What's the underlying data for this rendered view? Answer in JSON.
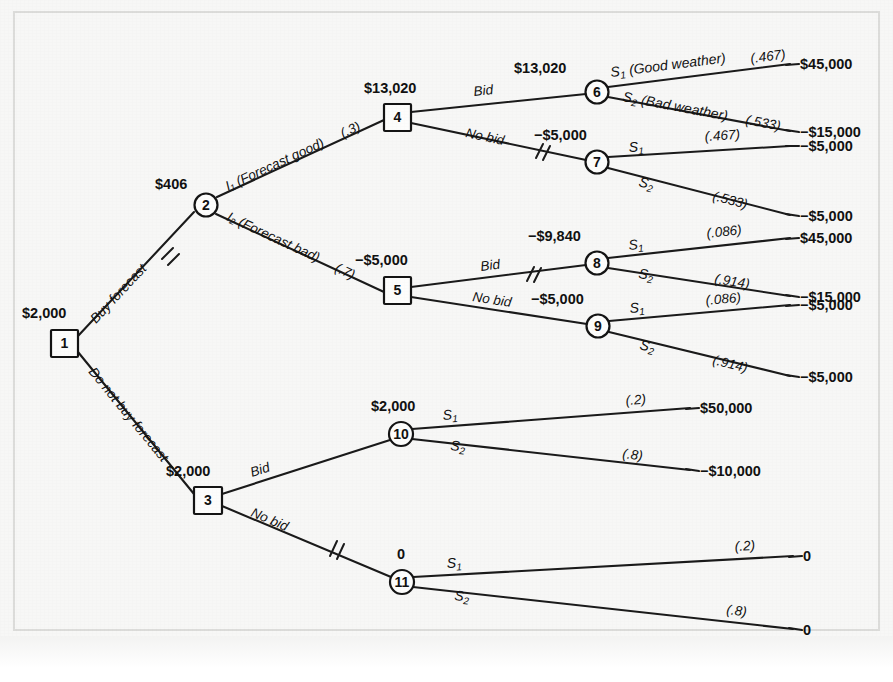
{
  "diagram": {
    "type": "decision-tree",
    "ink_color": "#141414",
    "paper_color": "#f7f7f6"
  },
  "nodes": [
    {
      "id": "1",
      "shape": "square",
      "label": "1",
      "ev": "$2,000",
      "x": 64,
      "y": 343
    },
    {
      "id": "2",
      "shape": "circle",
      "label": "2",
      "ev": "$406",
      "x": 206,
      "y": 205
    },
    {
      "id": "3",
      "shape": "square",
      "label": "3",
      "ev": "$2,000",
      "x": 208,
      "y": 500
    },
    {
      "id": "4",
      "shape": "square",
      "label": "4",
      "ev": "$13,020",
      "x": 397,
      "y": 117
    },
    {
      "id": "5",
      "shape": "square",
      "label": "5",
      "ev": "−$5,000",
      "x": 397,
      "y": 290
    },
    {
      "id": "6",
      "shape": "circle",
      "label": "6",
      "ev": "$13,020",
      "x": 597,
      "y": 92
    },
    {
      "id": "7",
      "shape": "circle",
      "label": "7",
      "ev": "−$5,000",
      "x": 597,
      "y": 162
    },
    {
      "id": "8",
      "shape": "circle",
      "label": "8",
      "ev": "−$9,840",
      "x": 597,
      "y": 263
    },
    {
      "id": "9",
      "shape": "circle",
      "label": "9",
      "ev": "−$5,000",
      "x": 598,
      "y": 326
    },
    {
      "id": "10",
      "shape": "circle",
      "label": "10",
      "ev": "$2,000",
      "x": 401,
      "y": 434
    },
    {
      "id": "11",
      "shape": "circle",
      "label": "11",
      "ev": "0",
      "x": 402,
      "y": 582
    }
  ],
  "branches": [
    {
      "from": "1",
      "to": "2",
      "label": "Buy forecast",
      "probability": "",
      "pruned": true
    },
    {
      "from": "1",
      "to": "3",
      "label": "Do not buy forecast",
      "probability": "",
      "pruned": false
    },
    {
      "from": "2",
      "to": "4",
      "label": "I₁ (Forecast good)",
      "probability": "(.3)",
      "pruned": false
    },
    {
      "from": "2",
      "to": "5",
      "label": "I₂ (Forecast bad)",
      "probability": "(.7)",
      "pruned": false
    },
    {
      "from": "4",
      "to": "6",
      "label": "Bid",
      "probability": "",
      "pruned": false
    },
    {
      "from": "4",
      "to": "7",
      "label": "No bid",
      "probability": "",
      "pruned": true
    },
    {
      "from": "5",
      "to": "8",
      "label": "Bid",
      "probability": "",
      "pruned": true
    },
    {
      "from": "5",
      "to": "9",
      "label": "No bid",
      "probability": "",
      "pruned": false
    },
    {
      "from": "3",
      "to": "10",
      "label": "Bid",
      "probability": "",
      "pruned": false
    },
    {
      "from": "3",
      "to": "11",
      "label": "No bid",
      "probability": "",
      "pruned": true
    }
  ],
  "outcome_branches": [
    {
      "from": "6",
      "state": "S₁ (Good weather)",
      "probability": "(.467)",
      "payoff": "$45,000"
    },
    {
      "from": "6",
      "state": "S₂ (Bad weather)",
      "probability": "(.533)",
      "payoff": "−$15,000"
    },
    {
      "from": "7",
      "state": "S₁",
      "probability": "(.467)",
      "payoff": "−$5,000"
    },
    {
      "from": "7",
      "state": "S₂",
      "probability": "(.533)",
      "payoff": "−$5,000"
    },
    {
      "from": "8",
      "state": "S₁",
      "probability": "(.086)",
      "payoff": "$45,000"
    },
    {
      "from": "8",
      "state": "S₂",
      "probability": "(.914)",
      "payoff": "−$15,000"
    },
    {
      "from": "9",
      "state": "S₁",
      "probability": "(.086)",
      "payoff": "−$5,000"
    },
    {
      "from": "9",
      "state": "S₂",
      "probability": "(.914)",
      "payoff": "−$5,000"
    },
    {
      "from": "10",
      "state": "S₁",
      "probability": "(.2)",
      "payoff": "$50,000"
    },
    {
      "from": "10",
      "state": "S₂",
      "probability": "(.8)",
      "payoff": "−$10,000"
    },
    {
      "from": "11",
      "state": "S₁",
      "probability": "(.2)",
      "payoff": "0"
    },
    {
      "from": "11",
      "state": "S₂",
      "probability": "(.8)",
      "payoff": "0"
    }
  ],
  "labels": {
    "node1_ev": "$2,000",
    "node2_ev": "$406",
    "node3_ev": "$2,000",
    "node4_ev": "$13,020",
    "node5_ev": "−$5,000",
    "node6_ev": "$13,020",
    "node7_ev": "−$5,000",
    "node8_ev": "−$9,840",
    "node9_ev": "−$5,000",
    "node10_ev": "$2,000",
    "node11_ev": "0",
    "n1": "1",
    "n2": "2",
    "n3": "3",
    "n4": "4",
    "n5": "5",
    "n6": "6",
    "n7": "7",
    "n8": "8",
    "n9": "9",
    "n10": "10",
    "n11": "11",
    "buy_forecast": "Buy forecast",
    "do_not_buy_forecast": "Do not buy forecast",
    "forecast_good": "I₁ (Forecast good)",
    "forecast_good_p": "(.3)",
    "forecast_bad": "I₂ (Forecast bad)",
    "forecast_bad_p": "(.7)",
    "bid_4": "Bid",
    "nobid_4": "No bid",
    "bid_5": "Bid",
    "nobid_5": "No bid",
    "bid_3": "Bid",
    "nobid_3": "No bid",
    "s1_good_weather": "S₁ (Good weather)",
    "s2_bad_weather": "S₂ (Bad weather)",
    "s1": "S₁",
    "s2": "S₂",
    "p_467a": "(.467)",
    "p_533a": "(.533)",
    "p_467b": "(.467)",
    "p_533b": "(.533)",
    "p_086a": "(.086)",
    "p_914a": "(.914)",
    "p_086b": "(.086)",
    "p_914b": "(.914)",
    "p_2a": "(.2)",
    "p_8a": "(.8)",
    "p_2b": "(.2)",
    "p_8b": "(.8)",
    "pay_45000a": "$45,000",
    "pay_15000a": "−$15,000",
    "pay_5000a": "−$5,000",
    "pay_5000b": "−$5,000",
    "pay_45000b": "$45,000",
    "pay_15000b": "−$15,000",
    "pay_5000c": "−$5,000",
    "pay_5000d": "−$5,000",
    "pay_50000": "$50,000",
    "pay_10000": "−$10,000",
    "pay_0a": "0",
    "pay_0b": "0"
  }
}
